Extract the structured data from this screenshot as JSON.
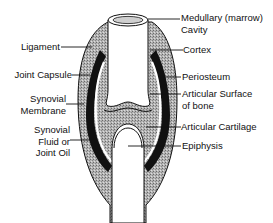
{
  "diagram": {
    "colors": {
      "outline": "#111111",
      "capsule_fill": "#a8a8a8",
      "periosteum_band": "#111111",
      "bone_fill": "#ffffff",
      "background": "#ffffff"
    },
    "labels_left": [
      {
        "id": "ligament",
        "lines": [
          "Ligament"
        ]
      },
      {
        "id": "joint-capsule",
        "lines": [
          "Joint Capsule"
        ]
      },
      {
        "id": "synovial-membrane",
        "lines": [
          "Synovial",
          "Membrane"
        ]
      },
      {
        "id": "synovial-fluid",
        "lines": [
          "Synovial",
          "Fluid or",
          "Joint Oil"
        ]
      }
    ],
    "labels_right": [
      {
        "id": "medullary-cavity",
        "lines": [
          "Medullary (marrow)",
          "Cavity"
        ]
      },
      {
        "id": "cortex",
        "lines": [
          "Cortex"
        ]
      },
      {
        "id": "periosteum",
        "lines": [
          "Periosteum"
        ]
      },
      {
        "id": "articular-surface",
        "lines": [
          "Articular Surface",
          "of bone"
        ]
      },
      {
        "id": "articular-cartilage",
        "lines": [
          "Articular Cartilage"
        ]
      },
      {
        "id": "epiphysis",
        "lines": [
          "Epiphysis"
        ]
      }
    ]
  }
}
